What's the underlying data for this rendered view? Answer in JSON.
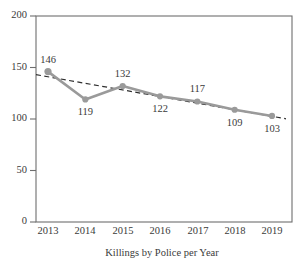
{
  "chart_data": {
    "type": "line",
    "title": "",
    "xlabel": "Killings by Police per Year",
    "ylabel": "",
    "categories": [
      "2013",
      "2014",
      "2015",
      "2016",
      "2017",
      "2018",
      "2019"
    ],
    "x": [
      2013,
      2014,
      2015,
      2016,
      2017,
      2018,
      2019
    ],
    "series": [
      {
        "name": "Killings by Police",
        "style": "solid-with-markers",
        "color": "#9a9a9a",
        "values": [
          146,
          119,
          132,
          122,
          117,
          109,
          103
        ],
        "labels": [
          "146",
          "119",
          "132",
          "122",
          "117",
          "109",
          "103"
        ],
        "label_positions": [
          "above",
          "below",
          "above",
          "below",
          "above",
          "below",
          "below"
        ]
      },
      {
        "name": "Linear trend",
        "style": "dashed",
        "color": "#2e2e2e",
        "values": [
          141,
          134.6,
          128.2,
          121.8,
          115.4,
          109,
          102.6
        ]
      }
    ],
    "ylim": [
      0,
      200
    ],
    "yticks": [
      0,
      50,
      100,
      150,
      200
    ],
    "ytick_labels": [
      "0",
      "50",
      "100",
      "150",
      "200"
    ],
    "xtick_labels": [
      "2013",
      "2014",
      "2015",
      "2016",
      "2017",
      "2018",
      "2019"
    ],
    "grid": false,
    "legend": false,
    "frame": "box",
    "colors": {
      "series": "#9a9a9a",
      "trend": "#2e2e2e",
      "axis": "#6e6e6e",
      "text": "#3a3a3a",
      "background": "#ffffff"
    }
  }
}
